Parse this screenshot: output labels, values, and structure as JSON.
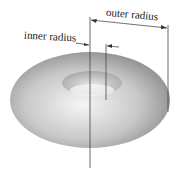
{
  "diagram": {
    "labels": {
      "outer": "outer radius",
      "inner": "inner radius"
    },
    "colors": {
      "line": "#333333",
      "torus_light": "#f2f2f2",
      "torus_dark": "#8a8a8a"
    }
  }
}
